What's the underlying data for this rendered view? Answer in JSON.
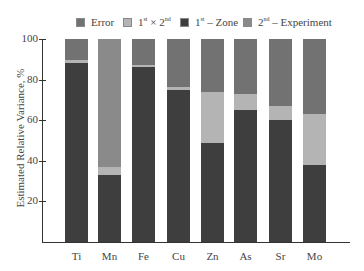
{
  "chart_data": {
    "type": "bar",
    "stacked": true,
    "title": "",
    "xlabel": "",
    "ylabel": "Estimated Relative Variance, %",
    "ylim": [
      0,
      100
    ],
    "yticks": [
      20,
      40,
      60,
      80,
      100
    ],
    "grid": false,
    "legend_position": "top",
    "categories": [
      "Ti",
      "Mn",
      "Fe",
      "Cu",
      "Zn",
      "As",
      "Sr",
      "Mo"
    ],
    "series": [
      {
        "name": "1st - Zone",
        "color": "#3e3e3e",
        "values": [
          88,
          33,
          86,
          75,
          49,
          65,
          60,
          38
        ]
      },
      {
        "name": "1st × 2nd",
        "color": "#b4b4b4",
        "values": [
          1.5,
          4,
          1,
          1.5,
          25,
          8,
          7,
          25
        ]
      },
      {
        "name": "2nd - Experiment",
        "color": "#8a8a8a",
        "values": [
          0,
          63,
          0,
          0,
          0,
          0,
          0,
          0
        ]
      },
      {
        "name": "Error",
        "color": "#727272",
        "values": [
          10.5,
          0,
          13,
          23.5,
          26,
          27,
          33,
          37
        ]
      }
    ]
  },
  "legend": [
    {
      "label": "Error",
      "base": "Error",
      "sup": "",
      "rest": "",
      "color": "#727272"
    },
    {
      "label": "1st × 2nd",
      "base": "1",
      "sup": "st",
      "rest": " × 2",
      "sup2": "nd",
      "color": "#b4b4b4"
    },
    {
      "label": "1st - Zone",
      "base": "1",
      "sup": "st",
      "rest": " – Zone",
      "sup2": "",
      "color": "#3e3e3e"
    },
    {
      "label": "2nd - Experiment",
      "base": "2",
      "sup": "nd",
      "rest": " – Experiment",
      "sup2": "",
      "color": "#8a8a8a"
    }
  ],
  "axis": {
    "ylabel": "Estimated Relative Variance, %",
    "yticks": [
      "20",
      "40",
      "60",
      "80",
      "100"
    ],
    "xticks": [
      "Ti",
      "Mn",
      "Fe",
      "Cu",
      "Zn",
      "As",
      "Sr",
      "Mo"
    ]
  }
}
